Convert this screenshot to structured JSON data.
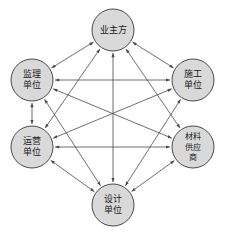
{
  "diagram": {
    "type": "network-graph",
    "colors": {
      "node_fill": "#d9d9d9",
      "node_stroke": "#4a4a4a",
      "edge": "#4a4a4a",
      "label_text": "#1a1a1a",
      "background": "#ffffff"
    },
    "nodes": [
      {
        "id": "owner",
        "label": "业主方",
        "lines": [
          "业主方"
        ],
        "cx": 113,
        "cy": 30,
        "r": 21,
        "font_size": 9
      },
      {
        "id": "supervision",
        "label": "监理单位",
        "lines": [
          "监理",
          "单位"
        ],
        "cx": 32,
        "cy": 80,
        "r": 21,
        "font_size": 9
      },
      {
        "id": "construction",
        "label": "施工单位",
        "lines": [
          "施工",
          "单位"
        ],
        "cx": 193,
        "cy": 80,
        "r": 21,
        "font_size": 9
      },
      {
        "id": "operation",
        "label": "运营单位",
        "lines": [
          "运营",
          "单位"
        ],
        "cx": 32,
        "cy": 147,
        "r": 21,
        "font_size": 9
      },
      {
        "id": "supplier",
        "label": "材料供应商",
        "lines": [
          "材料",
          "供应",
          "商"
        ],
        "cx": 193,
        "cy": 147,
        "r": 21,
        "font_size": 8
      },
      {
        "id": "design",
        "label": "设计单位",
        "lines": [
          "设计",
          "单位"
        ],
        "cx": 113,
        "cy": 205,
        "r": 21,
        "font_size": 9
      }
    ],
    "edges": [
      {
        "from": "owner",
        "to": "supervision",
        "arrows": "both"
      },
      {
        "from": "owner",
        "to": "construction",
        "arrows": "both"
      },
      {
        "from": "owner",
        "to": "operation",
        "arrows": "both"
      },
      {
        "from": "owner",
        "to": "supplier",
        "arrows": "both"
      },
      {
        "from": "owner",
        "to": "design",
        "arrows": "both"
      },
      {
        "from": "supervision",
        "to": "construction",
        "arrows": "both"
      },
      {
        "from": "supervision",
        "to": "operation",
        "arrows": "both"
      },
      {
        "from": "supervision",
        "to": "supplier",
        "arrows": "both"
      },
      {
        "from": "supervision",
        "to": "design",
        "arrows": "both"
      },
      {
        "from": "construction",
        "to": "operation",
        "arrows": "both"
      },
      {
        "from": "construction",
        "to": "design",
        "arrows": "both"
      },
      {
        "from": "operation",
        "to": "supplier",
        "arrows": "both"
      },
      {
        "from": "operation",
        "to": "design",
        "arrows": "both"
      },
      {
        "from": "supplier",
        "to": "design",
        "arrows": "both"
      }
    ]
  }
}
